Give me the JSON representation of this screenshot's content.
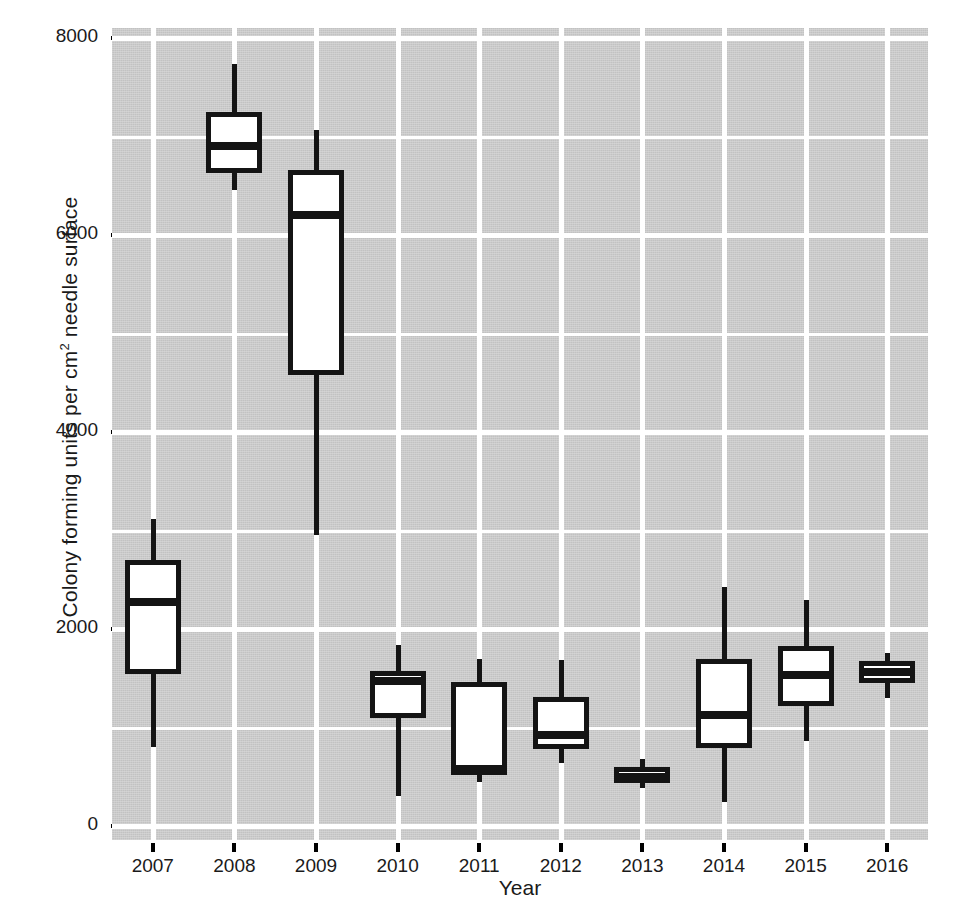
{
  "chart_data": {
    "type": "box",
    "title": "",
    "xlabel": "Year",
    "ylabel": "Colony forming units per cm² needle surface",
    "ylabel_prefix": "Colony forming units per cm",
    "ylabel_superscript": "2",
    "ylabel_suffix": " needle surface",
    "ylim": [
      0,
      8000
    ],
    "y_ticks": [
      0,
      2000,
      4000,
      6000,
      8000
    ],
    "y_tick_labels": [
      "0",
      "2000",
      "4000",
      "6000",
      "8000"
    ],
    "y_minor_ticks": [
      1000,
      3000,
      5000,
      7000
    ],
    "categories": [
      "2007",
      "2008",
      "2009",
      "2010",
      "2011",
      "2012",
      "2013",
      "2014",
      "2015",
      "2016"
    ],
    "grid": true,
    "legend": "none",
    "panel_background": "#c9c9c9",
    "grid_color": "#ffffff",
    "box_fill": "#ffffff",
    "box_line_color": "#141414",
    "boxes": [
      {
        "category": "2007",
        "whisker_low": 800,
        "q1": 1540,
        "median": 2270,
        "q3": 2700,
        "whisker_high": 3120
      },
      {
        "category": "2008",
        "whisker_low": 6460,
        "q1": 6630,
        "median": 6900,
        "q3": 7250,
        "whisker_high": 7740
      },
      {
        "category": "2009",
        "whisker_low": 2950,
        "q1": 4580,
        "median": 6200,
        "q3": 6660,
        "whisker_high": 7070
      },
      {
        "category": "2010",
        "whisker_low": 300,
        "q1": 1100,
        "median": 1470,
        "q3": 1570,
        "whisker_high": 1840
      },
      {
        "category": "2011",
        "whisker_low": 450,
        "q1": 520,
        "median": 580,
        "q3": 1460,
        "whisker_high": 1700
      },
      {
        "category": "2012",
        "whisker_low": 640,
        "q1": 780,
        "median": 920,
        "q3": 1310,
        "whisker_high": 1690
      },
      {
        "category": "2013",
        "whisker_low": 390,
        "q1": 440,
        "median": 500,
        "q3": 600,
        "whisker_high": 680
      },
      {
        "category": "2014",
        "whisker_low": 240,
        "q1": 790,
        "median": 1130,
        "q3": 1700,
        "whisker_high": 2430
      },
      {
        "category": "2015",
        "whisker_low": 860,
        "q1": 1220,
        "median": 1530,
        "q3": 1830,
        "whisker_high": 2290
      },
      {
        "category": "2016",
        "whisker_low": 1300,
        "q1": 1450,
        "median": 1560,
        "q3": 1680,
        "whisker_high": 1760
      }
    ]
  }
}
